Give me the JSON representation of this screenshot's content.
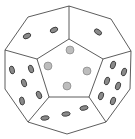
{
  "figure": {
    "subject": "twelve-sided die (dodecahedron) line illustration",
    "colors": {
      "background": "#ffffff",
      "edge": "#333333",
      "pip_dark": "#8a8a8a",
      "pip_light": "#bdbdbd"
    },
    "faces": [
      {
        "name": "center",
        "pips": 4
      },
      {
        "name": "top-left",
        "pips": 2
      },
      {
        "name": "top-right",
        "pips": 1
      },
      {
        "name": "left",
        "pips": 5
      },
      {
        "name": "right",
        "pips": 6
      },
      {
        "name": "bottom",
        "pips": 3
      }
    ]
  }
}
